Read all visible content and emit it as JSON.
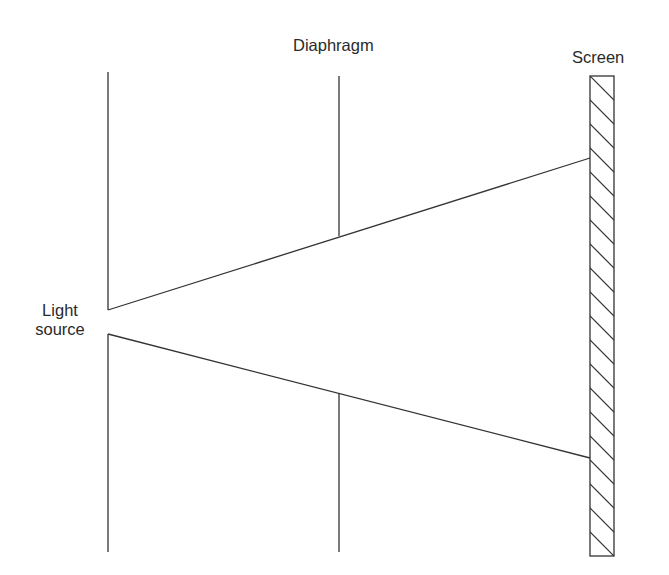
{
  "labels": {
    "diaphragm": "Diaphragm",
    "screen": "Screen",
    "light_source_line1": "Light",
    "light_source_line2": "source"
  },
  "colors": {
    "stroke": "#333333",
    "text": "#2a2a2a",
    "background": "#ffffff"
  },
  "geometry": {
    "source_line_x": 108,
    "diaphragm_x": 339,
    "screen_box": {
      "x": 590,
      "y": 76,
      "width": 24,
      "height": 480
    },
    "line_top": 72,
    "line_bottom": 552,
    "source_gap": [
      310,
      334
    ],
    "diaphragm_gap": [
      236,
      393
    ],
    "ray_upper_screen_y": 158,
    "ray_lower_screen_y": 458
  }
}
